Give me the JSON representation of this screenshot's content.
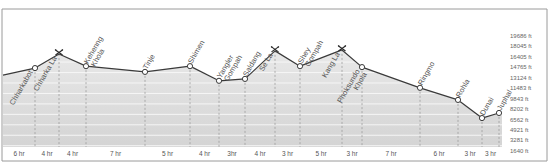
{
  "chart_data": {
    "type": "area",
    "title": "",
    "xlabel": "",
    "ylabel": "",
    "unit": "ft",
    "ylim": [
      0,
      21000
    ],
    "y_ticks": [
      1640,
      3281,
      4921,
      6562,
      8202,
      9843,
      11483,
      13124,
      14765,
      16405,
      18045,
      19686
    ],
    "y_tick_labels": [
      "1640 ft",
      "3281 ft",
      "4921 ft",
      "6562 ft",
      "8202 ft",
      "9843 ft",
      "11483 ft",
      "13124 ft",
      "14765 ft",
      "16405 ft",
      "18045 ft",
      "19686 ft"
    ],
    "grid": true,
    "start_elevation": 13550,
    "points": [
      {
        "name": "Chharkabot",
        "x": 1,
        "elevation": 14650,
        "type": "village"
      },
      {
        "name": "Chharka La",
        "x": 2,
        "elevation": 16850,
        "type": "pass"
      },
      {
        "name": "Kehenng Khola",
        "x": 3,
        "elevation": 14950,
        "type": "village"
      },
      {
        "name": "Tinje",
        "x": 4,
        "elevation": 14050,
        "type": "village"
      },
      {
        "name": "Shimen",
        "x": 5,
        "elevation": 14950,
        "type": "village"
      },
      {
        "name": "Yangler Gompah",
        "x": 6,
        "elevation": 12650,
        "type": "village"
      },
      {
        "name": "Saldang",
        "x": 7,
        "elevation": 12950,
        "type": "village"
      },
      {
        "name": "Se La",
        "x": 8,
        "elevation": 17350,
        "type": "pass"
      },
      {
        "name": "Shey Gompah",
        "x": 9,
        "elevation": 14950,
        "type": "village"
      },
      {
        "name": "Kang La",
        "x": 10,
        "elevation": 17500,
        "type": "pass"
      },
      {
        "name": "Phoksundo Khola",
        "x": 11,
        "elevation": 14800,
        "type": "village"
      },
      {
        "name": "Ringmo",
        "x": 12,
        "elevation": 11550,
        "type": "village"
      },
      {
        "name": "Rohla",
        "x": 13,
        "elevation": 9650,
        "type": "village"
      },
      {
        "name": "Dunai",
        "x": 14,
        "elevation": 6800,
        "type": "village"
      },
      {
        "name": "Juphal",
        "x": 15,
        "elevation": 7600,
        "type": "village"
      }
    ],
    "segment_durations": [
      "6 hr",
      "4 hr",
      "4 hr",
      "7 hr",
      "5 hr",
      "4 hr",
      "3hr",
      "4 hr",
      "3 hr",
      "5 hr",
      "3 hr",
      "7 hr",
      "6 hr",
      "3 hr",
      "3 hr"
    ]
  }
}
